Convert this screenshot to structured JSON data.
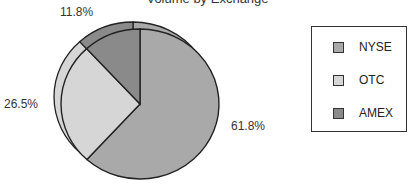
{
  "chart_data": {
    "type": "pie",
    "title": "Volume by Exchange",
    "categories": [
      "NYSE",
      "OTC",
      "AMEX"
    ],
    "values": [
      61.8,
      26.5,
      11.8
    ],
    "labels": [
      "61.8%",
      "26.5%",
      "11.8%"
    ],
    "colors": [
      "#a9a9a9",
      "#d6d6d6",
      "#8a8a8a"
    ],
    "legend_position": "right",
    "style": "3d-tilted"
  },
  "legend": {
    "items": [
      {
        "label": "NYSE",
        "color": "#a9a9a9"
      },
      {
        "label": "OTC",
        "color": "#d6d6d6"
      },
      {
        "label": "AMEX",
        "color": "#8a8a8a"
      }
    ]
  }
}
